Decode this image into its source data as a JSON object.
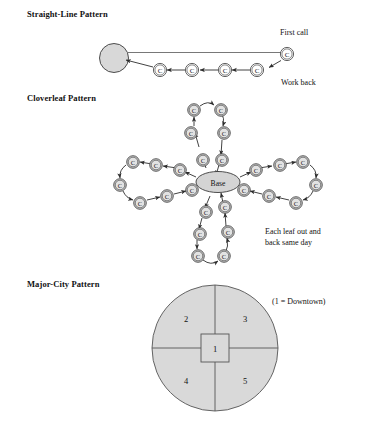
{
  "figure": {
    "sections": [
      {
        "id": "straight-line",
        "title": "Straight-Line Pattern",
        "labels": {
          "first_call": "First call",
          "work_back": "Work back"
        },
        "node_label": "C",
        "node_count": 5
      },
      {
        "id": "cloverleaf",
        "title": "Cloverleaf Pattern",
        "labels": {
          "base": "Base",
          "caption_line1": "Each leaf out and",
          "caption_line2": "back same day"
        },
        "node_label": "C",
        "leaf_count": 4,
        "nodes_per_leaf": 6
      },
      {
        "id": "major-city",
        "title": "Major-City Pattern",
        "labels": {
          "legend": "(1 = Downtown)"
        },
        "zones": [
          "1",
          "2",
          "3",
          "4",
          "5"
        ]
      }
    ]
  },
  "colors": {
    "node_fill": "#d8d8d8",
    "base_fill": "#d4d4d4",
    "zone_fill": "#d9d9d9",
    "stroke": "#3a3a3a",
    "text": "#111111",
    "background": "#ffffff"
  }
}
